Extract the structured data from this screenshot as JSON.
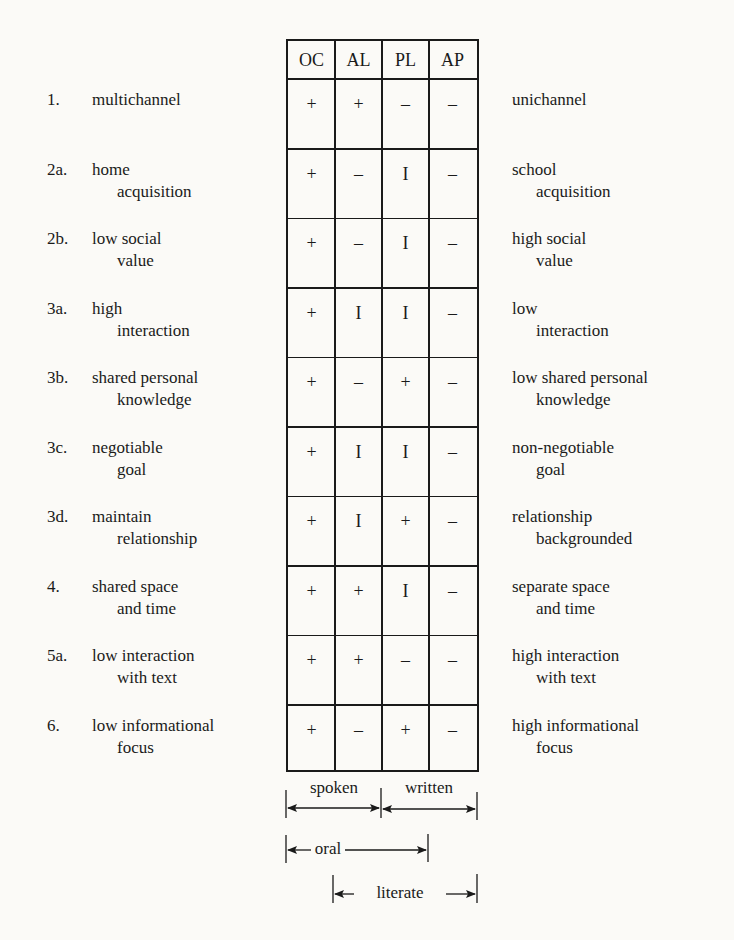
{
  "columns": [
    "OC",
    "AL",
    "PL",
    "AP"
  ],
  "rows": [
    {
      "num": "1.",
      "left": [
        "multichannel",
        ""
      ],
      "right": [
        "unichannel",
        ""
      ],
      "values": [
        "+",
        "+",
        "–",
        "–"
      ]
    },
    {
      "num": "2a.",
      "left": [
        "home",
        "acquisition"
      ],
      "right": [
        "school",
        "acquisition"
      ],
      "values": [
        "+",
        "–",
        "I",
        "–"
      ]
    },
    {
      "num": "2b.",
      "left": [
        "low social",
        "value"
      ],
      "right": [
        "high social",
        "value"
      ],
      "values": [
        "+",
        "–",
        "I",
        "–"
      ]
    },
    {
      "num": "3a.",
      "left": [
        "high",
        "interaction"
      ],
      "right": [
        "low",
        "interaction"
      ],
      "values": [
        "+",
        "I",
        "I",
        "–"
      ]
    },
    {
      "num": "3b.",
      "left": [
        "shared personal",
        "knowledge"
      ],
      "right": [
        "low shared personal",
        "knowledge"
      ],
      "values": [
        "+",
        "–",
        "+",
        "–"
      ]
    },
    {
      "num": "3c.",
      "left": [
        "negotiable",
        "goal"
      ],
      "right": [
        "non-negotiable",
        "goal"
      ],
      "values": [
        "+",
        "I",
        "I",
        "–"
      ]
    },
    {
      "num": "3d.",
      "left": [
        "maintain",
        "relationship"
      ],
      "right": [
        "relationship",
        "backgrounded"
      ],
      "values": [
        "+",
        "I",
        "+",
        "–"
      ]
    },
    {
      "num": "4.",
      "left": [
        "shared space",
        "and time"
      ],
      "right": [
        "separate space",
        "and time"
      ],
      "values": [
        "+",
        "+",
        "I",
        "–"
      ]
    },
    {
      "num": "5a.",
      "left": [
        "low interaction",
        "with text"
      ],
      "right": [
        "high interaction",
        "with text"
      ],
      "values": [
        "+",
        "+",
        "–",
        "–"
      ]
    },
    {
      "num": "6.",
      "left": [
        "low informational",
        "focus"
      ],
      "right": [
        "high informational",
        "focus"
      ],
      "values": [
        "+",
        "–",
        "+",
        "–"
      ]
    }
  ],
  "brackets": {
    "spoken": "spoken",
    "written": "written",
    "oral": "oral",
    "literate": "literate"
  },
  "colors": {
    "ink": "#1a1a1a",
    "background": "#fbfaf7"
  }
}
